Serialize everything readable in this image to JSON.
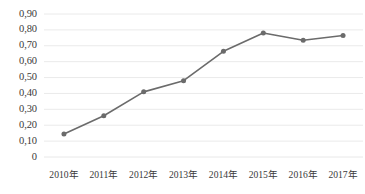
{
  "chart_data": {
    "type": "line",
    "title": "",
    "subtitle": "",
    "xlabel": "",
    "ylabel": "",
    "categories": [
      "2010年",
      "2011年",
      "2012年",
      "2013年",
      "2014年",
      "2015年",
      "2016年",
      "2017年"
    ],
    "values": [
      0.145,
      0.26,
      0.41,
      0.48,
      0.665,
      0.78,
      0.735,
      0.765
    ],
    "series": [
      {
        "name": "",
        "values": [
          0.145,
          0.26,
          0.41,
          0.48,
          0.665,
          0.78,
          0.735,
          0.765
        ]
      }
    ],
    "ylim": [
      0,
      0.9
    ],
    "ytick_values": [
      0,
      0.1,
      0.2,
      0.3,
      0.4,
      0.5,
      0.6,
      0.7,
      0.8,
      0.9
    ],
    "ytick_labels": [
      "0",
      "0,10",
      "0,20",
      "0,30",
      "0,40",
      "0,50",
      "0,60",
      "0,70",
      "0,80",
      "0,90"
    ],
    "grid": "horizontal",
    "legend": "none",
    "line_color": "#6b6b6b",
    "marker_color": "#6b6b6b",
    "grid_color": "#e8e8e8",
    "text_color": "#3a3a3a",
    "background_color": "#ffffff",
    "marker": "circle"
  }
}
